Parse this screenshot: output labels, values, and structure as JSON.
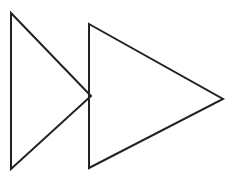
{
  "figure": {
    "canvas": {
      "width": 234,
      "height": 180,
      "background_color": "#ffffff"
    },
    "style": {
      "stroke_color": "#222222",
      "stroke_width": 2,
      "fill": "none"
    },
    "shapes": [
      {
        "name": "left-triangle",
        "label": "Left triangle",
        "orientation": "right-pointing",
        "points": "11,13 91,96 11,169",
        "vertices": [
          {
            "label": "top-left",
            "x": 11,
            "y": 13
          },
          {
            "label": "right-apex",
            "x": 91,
            "y": 96
          },
          {
            "label": "bottom-left",
            "x": 11,
            "y": 169
          }
        ],
        "note": "Right apex is overlapped by the left vertical edge of the right triangle."
      },
      {
        "name": "right-triangle",
        "label": "Right triangle",
        "orientation": "right-pointing",
        "points": "89,24 223,99 89,168",
        "vertices": [
          {
            "label": "top-left",
            "x": 89,
            "y": 24
          },
          {
            "label": "right-apex",
            "x": 223,
            "y": 99
          },
          {
            "label": "bottom-left",
            "x": 89,
            "y": 168
          }
        ],
        "note": "Drawn on top of the left triangle; its vertical left edge covers the left triangle's apex."
      }
    ]
  }
}
